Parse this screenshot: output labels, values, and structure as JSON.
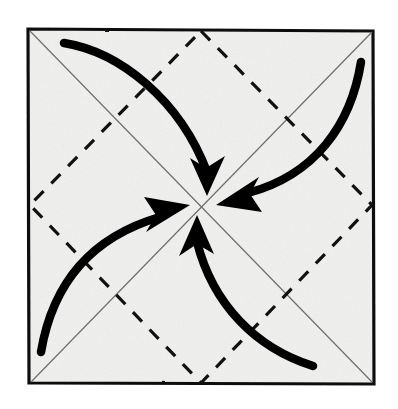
{
  "figure": {
    "title": "Origami fold diagram: four corners folded to center",
    "type": "origami-step-diagram",
    "canvas": {
      "width": 398,
      "height": 409
    },
    "background_color": "#ffffff"
  },
  "paper": {
    "label": "square-sheet",
    "fill_color": "#f1f1f0",
    "border_color": "#111111",
    "border_width": 3,
    "corners": {
      "top_left": [
        28,
        29
      ],
      "top_right": [
        373,
        31
      ],
      "bottom_right": [
        374,
        384
      ],
      "bottom_left": [
        29,
        383
      ]
    }
  },
  "creases": {
    "diagonals": {
      "label": "existing-diagonal-creases",
      "style": "solid-thin",
      "color": "#6e6e6e",
      "width": 1.2,
      "lines": [
        {
          "name": "diagonal-tl-br",
          "from": [
            30,
            31
          ],
          "to": [
            372,
            382
          ]
        },
        {
          "name": "diagonal-tr-bl",
          "from": [
            372,
            32
          ],
          "to": [
            31,
            382
          ]
        }
      ]
    },
    "diamond": {
      "label": "valley-fold-diamond",
      "style": "dashed",
      "color": "#111111",
      "width": 3.2,
      "dash_pattern": "13 11",
      "vertices": {
        "top": [
          201,
          31
        ],
        "right": [
          372,
          205
        ],
        "bottom": [
          201,
          383
        ],
        "left": [
          30,
          205
        ]
      }
    }
  },
  "arrows": {
    "label": "fold-direction-arrows",
    "color": "#000000",
    "count": 4,
    "converge_point": [
      201,
      206
    ],
    "items": [
      {
        "name": "arrow-top-left-to-center",
        "from_corner": "top-left",
        "start": [
          64,
          43
        ],
        "control": [
          175,
          70
        ],
        "end": [
          208,
          178
        ],
        "head_angle_deg": 74
      },
      {
        "name": "arrow-top-right-to-center",
        "from_corner": "top-right",
        "start": [
          361,
          62
        ],
        "control": [
          330,
          172
        ],
        "end": [
          231,
          195
        ],
        "head_angle_deg": 196
      },
      {
        "name": "arrow-bottom-right-to-center",
        "from_corner": "bottom-right",
        "start": [
          313,
          366
        ],
        "control": [
          225,
          330
        ],
        "end": [
          196,
          236
        ],
        "head_angle_deg": 252
      },
      {
        "name": "arrow-bottom-left-to-center",
        "from_corner": "bottom-left",
        "start": [
          41,
          352
        ],
        "control": [
          78,
          245
        ],
        "end": [
          172,
          216
        ],
        "head_angle_deg": 17
      }
    ]
  }
}
